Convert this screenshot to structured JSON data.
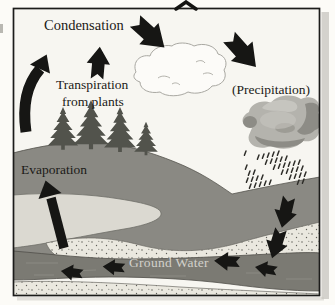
{
  "diagram": {
    "type": "water-cycle",
    "labels": {
      "condensation": "Condensation",
      "transpiration_line1": "Transpiration",
      "transpiration_line2": "from plants",
      "precipitation": "(Precipitation)",
      "evaporation": "Evaporation",
      "ground_water": "Ground Water"
    },
    "arrows": [
      {
        "name": "rising-air-arrow",
        "direction": "up-curved"
      },
      {
        "name": "transpiration-arrow",
        "direction": "up"
      },
      {
        "name": "condensation-to-cloud-arrow",
        "direction": "down-right"
      },
      {
        "name": "cloud-to-precipitation-arrow",
        "direction": "down-right"
      },
      {
        "name": "evaporation-arrow",
        "direction": "up"
      },
      {
        "name": "infiltration-arrows",
        "direction": "down",
        "count": 2
      },
      {
        "name": "groundwater-flow-arrows",
        "direction": "left",
        "count": 4
      }
    ],
    "colors": {
      "background": "#fcfbf7",
      "sky": "#f7f6f1",
      "land": "#8a8983",
      "lake": "#dbd9d1",
      "sand": "#eae8df",
      "stipple_dot": "#5f5e58",
      "groundwater_band": "#7b7a73",
      "gw_streak": "#9b9a92",
      "rain_cloud": "#b4b3ad",
      "rain_cloud_shadow": "#8d8c86",
      "rain_cloud_light": "#c8c7c1",
      "rain_speck": "#2f2e2a",
      "white_cloud_fill": "#fcfbf8",
      "white_cloud_outline": "#a9a8a2",
      "tree": "#52534c",
      "arrow": "#161614",
      "border": "#1c1c1a",
      "ground_water_text": "#d2d1cb",
      "page_shadow": "#c9c8c2"
    }
  }
}
